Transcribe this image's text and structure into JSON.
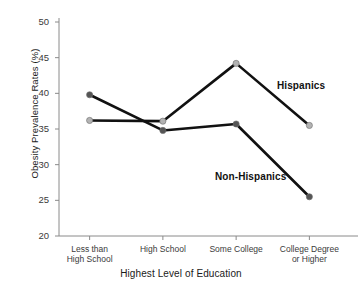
{
  "chart_data": {
    "type": "line",
    "title": "",
    "xlabel": "Highest Level of Education",
    "ylabel": "Obesity Prevalence Rates (%)",
    "categories": [
      "Less than\nHigh School",
      "High School",
      "Some College",
      "College Degree\nor Higher"
    ],
    "category_lines": [
      [
        "Less than",
        "High School"
      ],
      [
        "High School",
        ""
      ],
      [
        "Some College",
        ""
      ],
      [
        "College Degree",
        "or Higher"
      ]
    ],
    "series": [
      {
        "name": "Hispanics",
        "color": "#b3b3b3",
        "values": [
          36.2,
          36.1,
          44.2,
          35.5
        ]
      },
      {
        "name": "Non-Hispanics",
        "color": "#555555",
        "values": [
          39.8,
          34.8,
          35.7,
          25.5
        ]
      }
    ],
    "ylim": [
      20,
      50
    ],
    "yticks": [
      20,
      25,
      30,
      35,
      40,
      45,
      50
    ],
    "ytick_labels": [
      "20",
      "25",
      "30",
      "35",
      "40",
      "45",
      "50"
    ],
    "grid": false,
    "legend_position": "inline-annotations",
    "line_color": "#111111",
    "axis_color": "#8a8a8a"
  },
  "annotations": {
    "hispanics_label": "Hispanics",
    "non_hispanics_label": "Non-Hispanics"
  }
}
